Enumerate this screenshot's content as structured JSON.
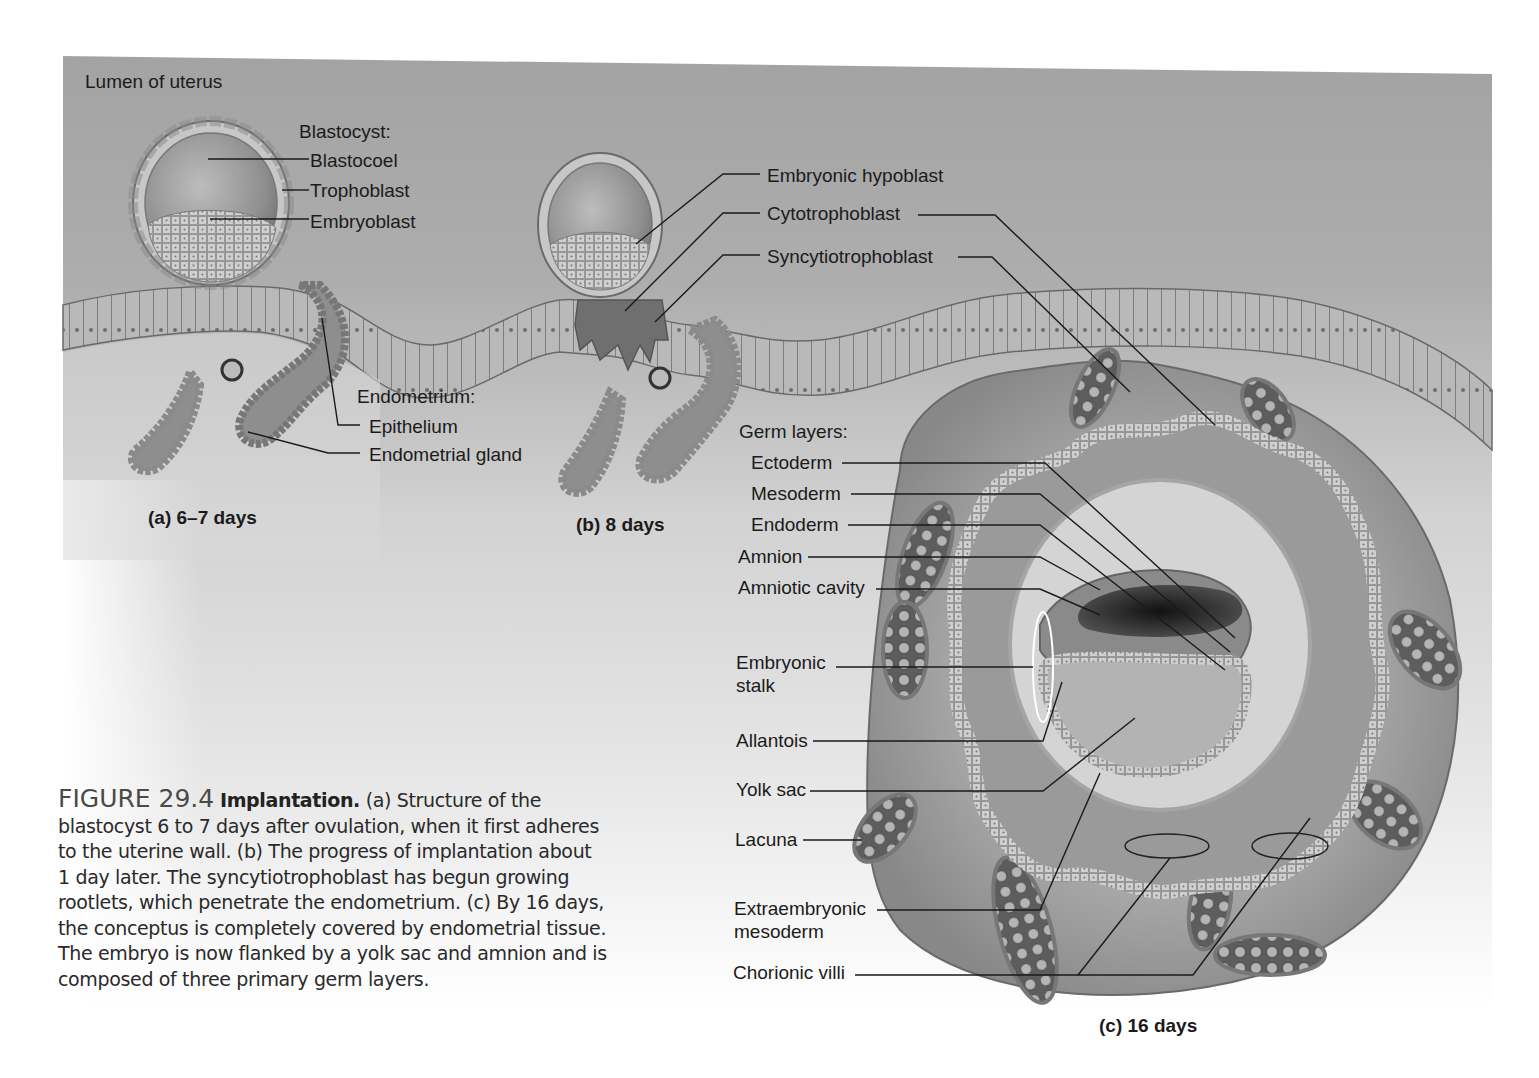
{
  "figure": {
    "number_label": "FIGURE 29.4",
    "title": "Implantation.",
    "caption_lines": [
      "(a) Structure of the",
      "blastocyst 6 to 7 days after ovulation, when it first adheres",
      "to the uterine wall. (b) The progress of implantation about",
      "1 day later. The syncytiotrophoblast has begun growing",
      "rootlets, which penetrate the endometrium. (c) By 16 days,",
      "the conceptus is completely covered by endometrial tissue.",
      "The embryo is now flanked by a yolk sac and amnion and is",
      "composed of three primary germ layers."
    ]
  },
  "labels": {
    "lumen": "Lumen of uterus",
    "blastocyst_heading": "Blastocyst:",
    "blastocoel": "Blastocoel",
    "trophoblast": "Trophoblast",
    "embryoblast": "Embryoblast",
    "endometrium_heading": "Endometrium:",
    "epithelium": "Epithelium",
    "endometrial_gland": "Endometrial gland",
    "embryonic_hypoblast": "Embryonic hypoblast",
    "cytotrophoblast": "Cytotrophoblast",
    "syncytiotrophoblast": "Syncytiotrophoblast",
    "germ_layers_heading": "Germ layers:",
    "ectoderm": "Ectoderm",
    "mesoderm": "Mesoderm",
    "endoderm": "Endoderm",
    "amnion": "Amnion",
    "amniotic_cavity": "Amniotic cavity",
    "embryonic_stalk_1": "Embryonic",
    "embryonic_stalk_2": "stalk",
    "allantois": "Allantois",
    "yolk_sac": "Yolk sac",
    "lacuna": "Lacuna",
    "extraembryonic_1": "Extraembryonic",
    "extraembryonic_2": "mesoderm",
    "chorionic_villi": "Chorionic villi"
  },
  "panels": {
    "a": "(a)  6–7 days",
    "b": "(b)  8 days",
    "c": "(c)  16 days"
  },
  "colors": {
    "panel_gray": "#9d9d9d",
    "tissue": "#b8b8b8",
    "tissue_dark": "#7d7d7d",
    "cell_outline": "#6a6a6a",
    "leader_line": "#1a1a1a",
    "cavity_dark": "#2a2a2a"
  }
}
